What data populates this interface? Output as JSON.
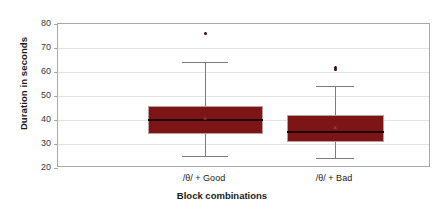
{
  "chart_data": {
    "type": "box",
    "title": "",
    "xlabel": "Block combinations",
    "ylabel": "Duration in seconds",
    "ylim": [
      20,
      80
    ],
    "ytick_labels": [
      "80",
      "70",
      "60",
      "50",
      "40",
      "30",
      "20"
    ],
    "ytick_values": [
      80,
      70,
      60,
      50,
      40,
      30,
      20
    ],
    "grid": true,
    "legend": "none",
    "categories": [
      "/θ/ + Good",
      "/θ/ + Bad"
    ],
    "series": [
      {
        "name": "/θ/ + Good",
        "whisker_low": 25,
        "q1": 34,
        "median": 40,
        "mean": 41,
        "q3": 46,
        "whisker_high": 64,
        "outliers": [
          76
        ]
      },
      {
        "name": "/θ/ + Bad",
        "whisker_low": 24,
        "q1": 31,
        "median": 35,
        "mean": 37,
        "q3": 42,
        "whisker_high": 54,
        "outliers": [
          61,
          62
        ]
      }
    ],
    "colors": {
      "box_fill": "#7d1416",
      "box_border": "#b8a0a0",
      "median": "#1a0406",
      "whisker": "#7b7b7b",
      "outlier": "#3d0608",
      "mean_marker": "#a85050",
      "gridline": "#e4e4e4",
      "frame": "#a9a9a9",
      "text": "#1b1b1b",
      "background": "#ffffff"
    },
    "mean_marker_glyph": "×"
  }
}
